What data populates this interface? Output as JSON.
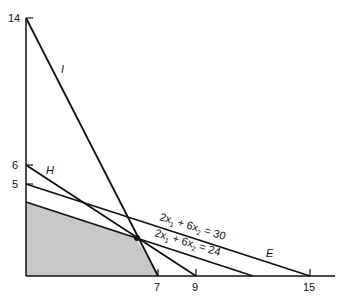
{
  "diagram": {
    "type": "linear-programming-feasible-region",
    "axes": {
      "origin_px": [
        26,
        276
      ],
      "x_scale_px_per_unit": 18.93,
      "y_scale_px_per_unit": 18.43,
      "x_ticks": [
        "7",
        "9",
        "15"
      ],
      "y_ticks": [
        "14",
        "6",
        "5"
      ]
    },
    "lines": [
      {
        "label": "I",
        "from": [
          0,
          14
        ],
        "to": [
          7,
          0
        ]
      },
      {
        "label": "H",
        "from": [
          0,
          6
        ],
        "to": [
          9,
          0
        ]
      },
      {
        "label": "E",
        "from": [
          0,
          5
        ],
        "to": [
          15,
          0
        ]
      },
      {
        "label": "",
        "from": [
          0,
          4
        ],
        "to": [
          12,
          0
        ]
      }
    ],
    "equations": [
      {
        "lhs_a": "2x",
        "sub_a": "1",
        "op": "+ 6x",
        "sub_b": "2",
        "rhs": "= 30"
      },
      {
        "lhs_a": "2x",
        "sub_a": "1",
        "op": "+ 6x",
        "sub_b": "2",
        "rhs": "= 24"
      }
    ],
    "feasible_region": {
      "vertices": [
        [
          0,
          0
        ],
        [
          0,
          4
        ],
        [
          5.83,
          2.06
        ],
        [
          7,
          0
        ]
      ],
      "fill": "#c8c8c8"
    },
    "optimal_point": [
      5.83,
      2.06
    ],
    "colors": {
      "line": "#111111",
      "shade": "#c8c8c8",
      "background": "#ffffff"
    }
  }
}
